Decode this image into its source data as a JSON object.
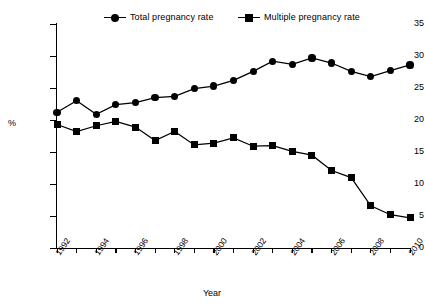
{
  "chart_data": {
    "type": "line",
    "title": "",
    "xlabel": "Year",
    "ylabel": "%",
    "xlim": [
      1992,
      2010
    ],
    "ylim": [
      0,
      35
    ],
    "ytick_values": [
      0,
      5,
      10,
      15,
      20,
      25,
      30,
      35
    ],
    "ytick_labels": [
      "0",
      "5",
      "10",
      "15",
      "20",
      "25",
      "30",
      "35"
    ],
    "x": [
      1992,
      1993,
      1994,
      1995,
      1996,
      1997,
      1998,
      1999,
      2000,
      2001,
      2002,
      2003,
      2004,
      2005,
      2006,
      2007,
      2008,
      2009,
      2010
    ],
    "xtick_labels": [
      "1992",
      "",
      "1994",
      "",
      "1996",
      "",
      "1998",
      "",
      "2000",
      "",
      "2002",
      "",
      "2004",
      "",
      "2006",
      "",
      "2008",
      "",
      "2010"
    ],
    "grid": false,
    "legend_position": "top",
    "series": [
      {
        "name": "Total pregnancy rate",
        "marker": "circle",
        "color": "#000000",
        "values": [
          21.2,
          23.0,
          20.9,
          22.4,
          22.7,
          23.5,
          23.7,
          24.9,
          25.3,
          26.2,
          27.6,
          29.2,
          28.7,
          29.7,
          28.9,
          27.6,
          26.8,
          27.7,
          28.6
        ]
      },
      {
        "name": "Multiple pregnancy rate",
        "marker": "square",
        "color": "#000000",
        "values": [
          19.3,
          18.2,
          19.1,
          19.8,
          18.9,
          16.8,
          18.2,
          16.1,
          16.4,
          17.2,
          15.9,
          16.0,
          15.1,
          14.5,
          12.1,
          11.0,
          6.6,
          5.2,
          4.7
        ]
      }
    ]
  },
  "axes": {
    "y_label": "%",
    "x_label": "Year"
  },
  "legend": {
    "entries": [
      {
        "label": "Total pregnancy rate",
        "marker": "circle-marker-icon"
      },
      {
        "label": "Multiple pregnancy rate",
        "marker": "square-marker-icon"
      }
    ]
  }
}
